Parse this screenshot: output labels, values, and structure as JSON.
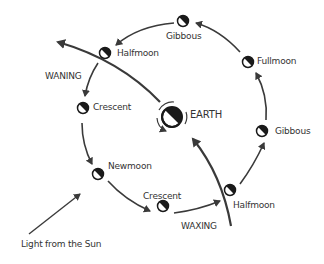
{
  "diagram": {
    "center": {
      "label": "EARTH"
    },
    "phases": [
      {
        "label": "Gibbous",
        "position": "top"
      },
      {
        "label": "Fullmoon",
        "position": "upper-right"
      },
      {
        "label": "Gibbous",
        "position": "right"
      },
      {
        "label": "Halfmoon",
        "position": "lower-right"
      },
      {
        "label": "Crescent",
        "position": "bottom"
      },
      {
        "label": "Newmoon",
        "position": "lower-left"
      },
      {
        "label": "Crescent",
        "position": "left"
      },
      {
        "label": "Halfmoon",
        "position": "upper-left"
      }
    ],
    "waning_label": "WANING",
    "waxing_label": "WAXING",
    "sun_label": "Light from the Sun",
    "colors": {
      "stroke": "#3a3a3a",
      "dark": "#1a1a1a",
      "light": "#ffffff",
      "text": "#333333"
    }
  }
}
